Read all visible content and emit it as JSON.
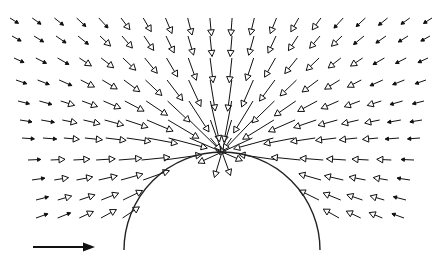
{
  "diagram": {
    "type": "vector-field",
    "colors": {
      "ink": "#111111",
      "background": "#ffffff"
    },
    "obstacle": {
      "shape": "semicircle",
      "cx": 222,
      "cy": 250,
      "r": 98
    },
    "reference_arrow": {
      "x1": 33,
      "y1": 247,
      "x2": 95,
      "y2": 247,
      "direction": "right"
    },
    "field": {
      "focus": {
        "x": 222,
        "y": 152
      },
      "rows": [
        {
          "y": 18,
          "x_start": 10,
          "x_end": 432,
          "count": 20
        },
        {
          "y": 36,
          "x_start": 12,
          "x_end": 430,
          "count": 20
        },
        {
          "y": 58,
          "x_start": 14,
          "x_end": 428,
          "count": 20
        },
        {
          "y": 80,
          "x_start": 16,
          "x_end": 426,
          "count": 20
        },
        {
          "y": 101,
          "x_start": 18,
          "x_end": 424,
          "count": 20
        },
        {
          "y": 120,
          "x_start": 20,
          "x_end": 422,
          "count": 20
        },
        {
          "y": 138,
          "x_start": 22,
          "x_end": 420,
          "count": 20
        },
        {
          "y": 160,
          "x_start": 28,
          "x_end": 414,
          "count": 18
        },
        {
          "y": 180,
          "x_start": 32,
          "x_end": 410,
          "count": 18
        },
        {
          "y": 200,
          "x_start": 36,
          "x_end": 406,
          "count": 18
        },
        {
          "y": 218,
          "x_start": 36,
          "x_end": 404,
          "count": 18
        }
      ]
    }
  }
}
